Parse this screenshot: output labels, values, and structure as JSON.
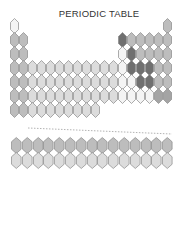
{
  "title": "PERIODIC TABLE",
  "palette": {
    "white": "#f4f4f4",
    "light": "#dcdcdc",
    "mid": "#bdbdbd",
    "midDark": "#a4a4a4",
    "dark": "#707070",
    "outline": "#8a8a8a"
  },
  "grid": {
    "main": {
      "x0": 10,
      "y0": 18,
      "dx": 9,
      "dy": 14,
      "w": 9,
      "h": 16,
      "columns": 18,
      "rows": 7
    },
    "fblock": {
      "x0": 11,
      "y0": 137,
      "dx": 10.8,
      "dy": 15,
      "w": 10.6,
      "h": 17,
      "columns": 15,
      "rows": 2
    }
  },
  "main_cells": [
    {
      "r": 1,
      "c": 1,
      "shade": "white"
    },
    {
      "r": 1,
      "c": 18,
      "shade": "mid"
    },
    {
      "r": 2,
      "c": 1,
      "shade": "mid"
    },
    {
      "r": 2,
      "c": 2,
      "shade": "mid"
    },
    {
      "r": 2,
      "c": 13,
      "shade": "dark"
    },
    {
      "r": 2,
      "c": 14,
      "shade": "mid"
    },
    {
      "r": 2,
      "c": 15,
      "shade": "mid"
    },
    {
      "r": 2,
      "c": 16,
      "shade": "mid"
    },
    {
      "r": 2,
      "c": 17,
      "shade": "mid"
    },
    {
      "r": 2,
      "c": 18,
      "shade": "mid"
    },
    {
      "r": 3,
      "c": 1,
      "shade": "mid"
    },
    {
      "r": 3,
      "c": 2,
      "shade": "mid"
    },
    {
      "r": 3,
      "c": 13,
      "shade": "white"
    },
    {
      "r": 3,
      "c": 14,
      "shade": "dark"
    },
    {
      "r": 3,
      "c": 15,
      "shade": "mid"
    },
    {
      "r": 3,
      "c": 16,
      "shade": "mid"
    },
    {
      "r": 3,
      "c": 17,
      "shade": "mid"
    },
    {
      "r": 3,
      "c": 18,
      "shade": "mid"
    },
    {
      "r": 4,
      "c": 1,
      "shade": "mid"
    },
    {
      "r": 4,
      "c": 2,
      "shade": "mid"
    },
    {
      "r": 4,
      "c": 3,
      "shade": "light"
    },
    {
      "r": 4,
      "c": 4,
      "shade": "light"
    },
    {
      "r": 4,
      "c": 5,
      "shade": "light"
    },
    {
      "r": 4,
      "c": 6,
      "shade": "light"
    },
    {
      "r": 4,
      "c": 7,
      "shade": "light"
    },
    {
      "r": 4,
      "c": 8,
      "shade": "light"
    },
    {
      "r": 4,
      "c": 9,
      "shade": "light"
    },
    {
      "r": 4,
      "c": 10,
      "shade": "light"
    },
    {
      "r": 4,
      "c": 11,
      "shade": "light"
    },
    {
      "r": 4,
      "c": 12,
      "shade": "light"
    },
    {
      "r": 4,
      "c": 13,
      "shade": "white"
    },
    {
      "r": 4,
      "c": 14,
      "shade": "dark"
    },
    {
      "r": 4,
      "c": 15,
      "shade": "dark"
    },
    {
      "r": 4,
      "c": 16,
      "shade": "dark"
    },
    {
      "r": 4,
      "c": 17,
      "shade": "mid"
    },
    {
      "r": 4,
      "c": 18,
      "shade": "mid"
    },
    {
      "r": 5,
      "c": 1,
      "shade": "mid"
    },
    {
      "r": 5,
      "c": 2,
      "shade": "mid"
    },
    {
      "r": 5,
      "c": 3,
      "shade": "light"
    },
    {
      "r": 5,
      "c": 4,
      "shade": "light"
    },
    {
      "r": 5,
      "c": 5,
      "shade": "light"
    },
    {
      "r": 5,
      "c": 6,
      "shade": "light"
    },
    {
      "r": 5,
      "c": 7,
      "shade": "light"
    },
    {
      "r": 5,
      "c": 8,
      "shade": "light"
    },
    {
      "r": 5,
      "c": 9,
      "shade": "light"
    },
    {
      "r": 5,
      "c": 10,
      "shade": "light"
    },
    {
      "r": 5,
      "c": 11,
      "shade": "light"
    },
    {
      "r": 5,
      "c": 12,
      "shade": "light"
    },
    {
      "r": 5,
      "c": 13,
      "shade": "white"
    },
    {
      "r": 5,
      "c": 14,
      "shade": "white"
    },
    {
      "r": 5,
      "c": 15,
      "shade": "dark"
    },
    {
      "r": 5,
      "c": 16,
      "shade": "dark"
    },
    {
      "r": 5,
      "c": 17,
      "shade": "mid"
    },
    {
      "r": 5,
      "c": 18,
      "shade": "mid"
    },
    {
      "r": 6,
      "c": 1,
      "shade": "mid"
    },
    {
      "r": 6,
      "c": 2,
      "shade": "mid"
    },
    {
      "r": 6,
      "c": 3,
      "shade": "light"
    },
    {
      "r": 6,
      "c": 4,
      "shade": "light"
    },
    {
      "r": 6,
      "c": 5,
      "shade": "light"
    },
    {
      "r": 6,
      "c": 6,
      "shade": "light"
    },
    {
      "r": 6,
      "c": 7,
      "shade": "light"
    },
    {
      "r": 6,
      "c": 8,
      "shade": "light"
    },
    {
      "r": 6,
      "c": 9,
      "shade": "light"
    },
    {
      "r": 6,
      "c": 10,
      "shade": "light"
    },
    {
      "r": 6,
      "c": 11,
      "shade": "light"
    },
    {
      "r": 6,
      "c": 12,
      "shade": "light"
    },
    {
      "r": 6,
      "c": 13,
      "shade": "white"
    },
    {
      "r": 6,
      "c": 14,
      "shade": "white"
    },
    {
      "r": 6,
      "c": 15,
      "shade": "white"
    },
    {
      "r": 6,
      "c": 16,
      "shade": "white"
    },
    {
      "r": 6,
      "c": 17,
      "shade": "midDark"
    },
    {
      "r": 6,
      "c": 18,
      "shade": "midDark"
    },
    {
      "r": 7,
      "c": 1,
      "shade": "mid"
    },
    {
      "r": 7,
      "c": 2,
      "shade": "mid"
    },
    {
      "r": 7,
      "c": 3,
      "shade": "light"
    },
    {
      "r": 7,
      "c": 4,
      "shade": "light"
    },
    {
      "r": 7,
      "c": 5,
      "shade": "light"
    },
    {
      "r": 7,
      "c": 6,
      "shade": "light"
    },
    {
      "r": 7,
      "c": 7,
      "shade": "light"
    },
    {
      "r": 7,
      "c": 8,
      "shade": "light"
    },
    {
      "r": 7,
      "c": 9,
      "shade": "light"
    },
    {
      "r": 7,
      "c": 10,
      "shade": "light"
    }
  ],
  "fblock_rows": [
    {
      "label": "lanthanides",
      "shade": "mid",
      "count": 15
    },
    {
      "label": "actinides",
      "shade": "light",
      "count": 15
    }
  ],
  "divider": {
    "x1": 28,
    "y1": 128,
    "x2": 172,
    "y2": 134,
    "color": "#a0a0a0"
  }
}
